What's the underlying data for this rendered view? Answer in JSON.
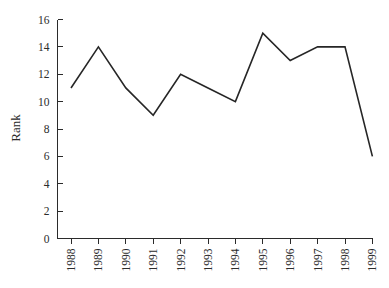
{
  "chart_data": {
    "type": "line",
    "title": "",
    "subtitle": "",
    "xlabel": "",
    "ylabel": "Rank",
    "categories": [
      "1988",
      "1989",
      "1990",
      "1991",
      "1992",
      "1993",
      "1994",
      "1995",
      "1996",
      "1997",
      "1998",
      "1999"
    ],
    "values": [
      11,
      14,
      11,
      9,
      12,
      11,
      10,
      15,
      13,
      14,
      14,
      6
    ],
    "series": [
      {
        "name": "Rank",
        "values": [
          11,
          14,
          11,
          9,
          12,
          11,
          10,
          15,
          13,
          14,
          14,
          6
        ]
      }
    ],
    "ylim": [
      0,
      16
    ],
    "ytick_labels": [
      "0",
      "2",
      "4",
      "6",
      "8",
      "10",
      "12",
      "14",
      "16"
    ],
    "ytick_values": [
      0,
      2,
      4,
      6,
      8,
      10,
      12,
      14,
      16
    ],
    "xtick_labels": [
      "1988",
      "1989",
      "1990",
      "1991",
      "1992",
      "1993",
      "1994",
      "1995",
      "1996",
      "1997",
      "1998",
      "1999"
    ],
    "xtick_rotation": 90,
    "grid": false,
    "legend": false,
    "legend_position": "none",
    "line_color": "#262626",
    "axis_color": "#2b2b2b",
    "background_color": "#ffffff",
    "annotations": []
  }
}
